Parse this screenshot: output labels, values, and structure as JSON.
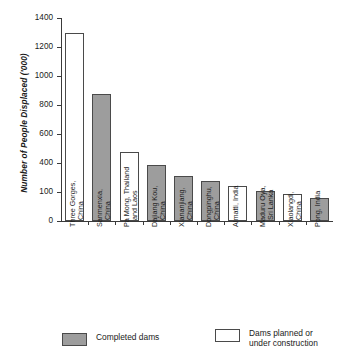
{
  "chart_data": {
    "type": "bar",
    "title": "",
    "xlabel": "",
    "ylabel": "Number of People Displaced ('000)",
    "ylim": [
      0,
      1400
    ],
    "ytick_labels": [
      "0",
      "100",
      "400",
      "600",
      "800",
      "1000",
      "1200",
      "1400"
    ],
    "ytick_values": [
      0,
      200,
      400,
      600,
      800,
      1000,
      1200,
      1400
    ],
    "grid": false,
    "legend_position": "bottom",
    "categories": [
      "Three Gorges, China",
      "Sanmenxia, China",
      "Pa Mong, Thailand and Laos",
      "Dajiang Kou, China",
      "Xiananjiang, China",
      "Dongpinghu, China",
      "Almatti, India",
      "Maduru Oya, Sri Lanka",
      "Xiaolangdi, China",
      "Pong, India"
    ],
    "values": [
      1300,
      875,
      475,
      385,
      310,
      275,
      240,
      205,
      185,
      160
    ],
    "series": [
      {
        "name": "Completed dams",
        "values": [
          null,
          875,
          null,
          385,
          310,
          275,
          null,
          205,
          null,
          160
        ]
      },
      {
        "name": "Dams planned or under construction",
        "values": [
          1300,
          null,
          475,
          null,
          null,
          null,
          240,
          null,
          185,
          null
        ]
      }
    ],
    "bar_types": [
      "planned",
      "completed",
      "planned",
      "completed",
      "completed",
      "completed",
      "planned",
      "completed",
      "planned",
      "completed"
    ],
    "colors": {
      "completed": "#9d9d9d",
      "planned": "#ffffff",
      "bar_outline": "#4a4a4a",
      "axis": "#3a3a3a",
      "text": "#1a1a1a"
    }
  },
  "category_lines": [
    [
      "Three Gorges,",
      "China"
    ],
    [
      "Sanmenxia,",
      "China"
    ],
    [
      "Pa Mong, Thailand",
      "and Laos"
    ],
    [
      "Dajiang Kou,",
      "China"
    ],
    [
      "Xiananjiang,",
      "China"
    ],
    [
      "Dongpinghu,",
      "China"
    ],
    [
      "Almatti, India",
      ""
    ],
    [
      "Maduru Oya,",
      "Sri Lanka"
    ],
    [
      "Xiaolangdi,",
      "China"
    ],
    [
      "Pong, India",
      ""
    ]
  ],
  "legend": {
    "completed": {
      "line1": "Completed dams",
      "line2": ""
    },
    "planned": {
      "line1": "Dams planned or",
      "line2": "under construction"
    }
  }
}
